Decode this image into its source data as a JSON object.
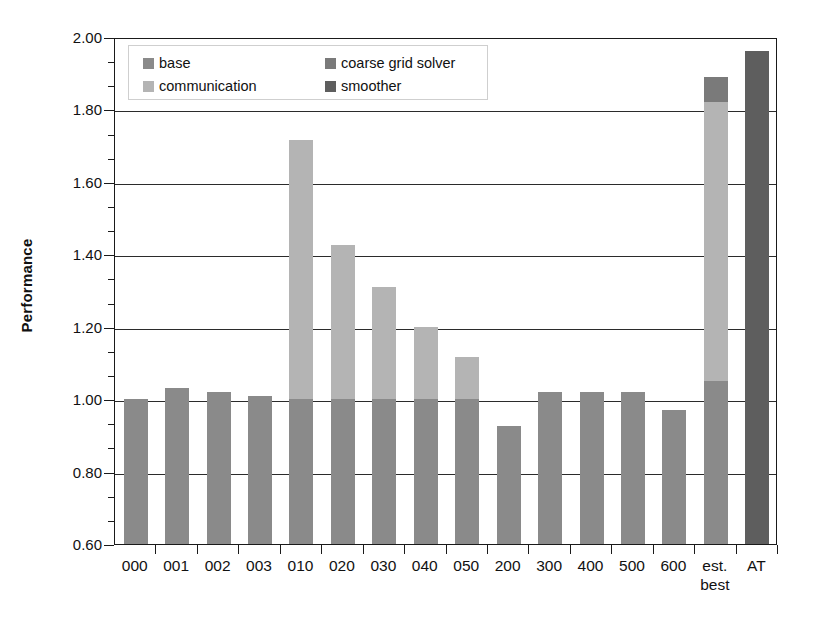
{
  "chart_data": {
    "type": "bar",
    "stacked": true,
    "title": "",
    "xlabel": "",
    "ylabel": "Performance",
    "ylim": [
      0.6,
      2.0
    ],
    "ytick_values": [
      "0.60",
      "0.80",
      "1.00",
      "1.20",
      "1.40",
      "1.60",
      "1.80",
      "2.00"
    ],
    "ytick_step": 0.2,
    "minor_ticks_per_major": 2,
    "grid": "horizontal",
    "legend_position": "top-left-inside",
    "categories": [
      "000",
      "001",
      "002",
      "003",
      "010",
      "020",
      "030",
      "040",
      "050",
      "200",
      "300",
      "400",
      "500",
      "600",
      "est. best",
      "AT"
    ],
    "category_labels_multiline": {
      "est. best": [
        "est.",
        "best"
      ]
    },
    "series": [
      {
        "name": "base",
        "color": "#8a8a8a",
        "values": [
          1.0,
          1.03,
          1.02,
          1.01,
          1.0,
          1.0,
          1.0,
          1.0,
          1.0,
          0.925,
          1.02,
          1.02,
          1.02,
          0.97,
          1.05,
          null
        ]
      },
      {
        "name": "communication",
        "color": "#b4b4b4",
        "values": [
          null,
          null,
          null,
          null,
          1.715,
          1.425,
          1.31,
          1.2,
          1.115,
          null,
          null,
          null,
          null,
          null,
          1.82,
          null
        ]
      },
      {
        "name": "coarse grid solver",
        "color": "#7a7a7a",
        "values": [
          null,
          null,
          null,
          null,
          null,
          null,
          null,
          null,
          null,
          null,
          null,
          null,
          null,
          null,
          1.89,
          null
        ]
      },
      {
        "name": "smoother",
        "color": "#5e5e5e",
        "values": [
          null,
          null,
          null,
          null,
          null,
          null,
          null,
          null,
          null,
          null,
          null,
          null,
          null,
          null,
          null,
          1.96
        ]
      }
    ],
    "bar_totals": [
      1.0,
      1.03,
      1.02,
      1.01,
      1.715,
      1.425,
      1.31,
      1.2,
      1.115,
      0.925,
      1.02,
      1.02,
      1.02,
      0.97,
      1.89,
      1.96
    ]
  },
  "legend": {
    "entries": [
      {
        "label": "base",
        "color": "#8a8a8a"
      },
      {
        "label": "coarse grid solver",
        "color": "#7a7a7a"
      },
      {
        "label": "communication",
        "color": "#b4b4b4"
      },
      {
        "label": "smoother",
        "color": "#5e5e5e"
      }
    ]
  },
  "axes": {
    "y_title": "Performance"
  }
}
